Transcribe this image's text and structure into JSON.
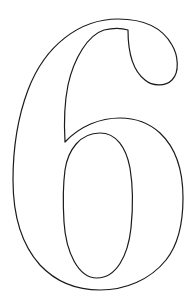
{
  "figure": {
    "glyph": "6",
    "stroke_color": "#1a1a1a",
    "background_color": "#ffffff",
    "stroke_width": 1.2
  }
}
